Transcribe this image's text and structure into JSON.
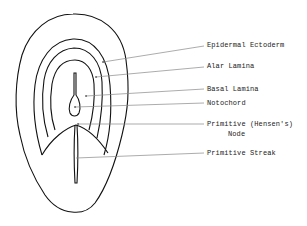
{
  "diagram": {
    "title": "",
    "labels": [
      {
        "id": "epidermal-ectoderm",
        "text": "Epidermal Ectoderm"
      },
      {
        "id": "alar-lamina",
        "text": "Alar Lamina"
      },
      {
        "id": "basal-lamina",
        "text": "Basal Lamina"
      },
      {
        "id": "notochord",
        "text": "Notochord"
      },
      {
        "id": "primitive-node",
        "text": "Primitive (Hensen's)",
        "text2": "Node"
      },
      {
        "id": "primitive-streak",
        "text": "Primitive Streak"
      }
    ],
    "colors": {
      "line": "#111111",
      "leader": "#888888",
      "background": "#ffffff"
    }
  }
}
